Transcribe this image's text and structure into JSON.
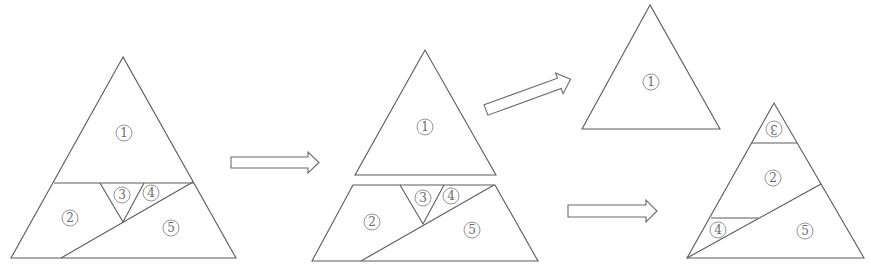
{
  "figure": {
    "colors": {
      "stroke": "#5a5a5a",
      "label": "#6a6a6a",
      "background": "#ffffff"
    },
    "labels": [
      "1",
      "2",
      "3",
      "4",
      "5"
    ],
    "panels": [
      {
        "name": "original-triangle",
        "pieces": [
          {
            "id": "1",
            "label": "1",
            "x": 124,
            "y": 133
          },
          {
            "id": "2",
            "label": "2",
            "x": 70,
            "y": 218
          },
          {
            "id": "3",
            "label": "3",
            "x": 122,
            "y": 195
          },
          {
            "id": "4",
            "label": "4",
            "x": 151,
            "y": 193
          },
          {
            "id": "5",
            "label": "5",
            "x": 171,
            "y": 228
          }
        ]
      },
      {
        "name": "separated-pieces",
        "pieces": [
          {
            "id": "1",
            "label": "1",
            "x": 425,
            "y": 127
          },
          {
            "id": "2",
            "label": "2",
            "x": 372,
            "y": 222
          },
          {
            "id": "3",
            "label": "3",
            "x": 423,
            "y": 198
          },
          {
            "id": "4",
            "label": "4",
            "x": 451,
            "y": 196
          },
          {
            "id": "5",
            "label": "5",
            "x": 472,
            "y": 230
          }
        ]
      },
      {
        "name": "result-triangle-top",
        "pieces": [
          {
            "id": "1",
            "label": "1",
            "x": 651,
            "y": 82
          }
        ]
      },
      {
        "name": "result-triangle-bottom",
        "pieces": [
          {
            "id": "3",
            "label": "3",
            "x": 774,
            "y": 129,
            "rotated": true
          },
          {
            "id": "2",
            "label": "2",
            "x": 773,
            "y": 178
          },
          {
            "id": "4",
            "label": "4",
            "x": 718,
            "y": 230
          },
          {
            "id": "5",
            "label": "5",
            "x": 805,
            "y": 231
          }
        ]
      }
    ],
    "arrows": [
      {
        "name": "arrow-right-1",
        "direction": "right"
      },
      {
        "name": "arrow-up-right",
        "direction": "up-right"
      },
      {
        "name": "arrow-right-2",
        "direction": "right"
      }
    ]
  }
}
